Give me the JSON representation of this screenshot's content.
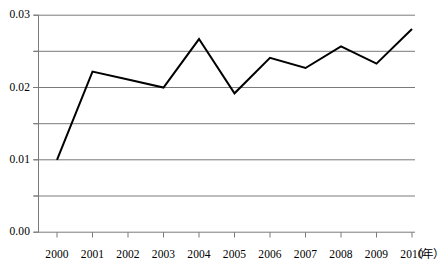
{
  "chart_data": {
    "type": "line",
    "title": "",
    "xlabel": "年",
    "ylabel": "",
    "x": [
      2000,
      2001,
      2002,
      2003,
      2004,
      2005,
      2006,
      2007,
      2008,
      2009,
      2010
    ],
    "categories": [
      "2000",
      "2001",
      "2002",
      "2003",
      "2004",
      "2005",
      "2006",
      "2007",
      "2008",
      "2009",
      "2010"
    ],
    "values": [
      0.01,
      0.0222,
      0.0211,
      0.02,
      0.0267,
      0.0192,
      0.0241,
      0.0227,
      0.0257,
      0.0233,
      0.0281
    ],
    "series": [
      {
        "name": "",
        "values": [
          0.01,
          0.0222,
          0.0211,
          0.02,
          0.0267,
          0.0192,
          0.0241,
          0.0227,
          0.0257,
          0.0233,
          0.0281
        ]
      }
    ],
    "xlim": [
      2000,
      2010
    ],
    "ylim": [
      0.0,
      0.03
    ],
    "ytick_labels": [
      "0.03",
      "0.02",
      "0.01",
      "0.00"
    ],
    "ytick_values": [
      0.03,
      0.02,
      0.01,
      0.0
    ],
    "gridline_values": [
      0.03,
      0.025,
      0.02,
      0.015,
      0.01,
      0.005,
      0.0
    ],
    "grid": true,
    "legend": "none",
    "line_color": "#000000",
    "grid_color": "#808080",
    "axis_color": "#808080",
    "background": "#ffffff"
  },
  "axis": {
    "y_labels": [
      "0.03",
      "0.02",
      "0.01",
      "0.00"
    ],
    "x_labels": [
      "2000",
      "2001",
      "2002",
      "2003",
      "2004",
      "2005",
      "2006",
      "2007",
      "2008",
      "2009",
      "2010"
    ],
    "x_unit": "（年）"
  }
}
